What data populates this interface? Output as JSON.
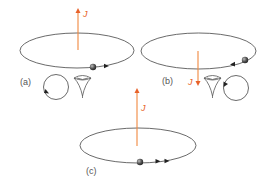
{
  "figure": {
    "panels": [
      {
        "id": "a",
        "label": "(a)",
        "angular_momentum_label": "J",
        "angular_momentum_direction": "up",
        "orbit_direction": "counterclockwise-from-above",
        "observer_view_rotation": "counterclockwise"
      },
      {
        "id": "b",
        "label": "(b)",
        "angular_momentum_label": "J",
        "angular_momentum_direction": "down",
        "orbit_direction": "clockwise-from-above",
        "observer_view_rotation": "clockwise"
      },
      {
        "id": "c",
        "label": "(c)",
        "angular_momentum_label": "J",
        "angular_momentum_direction": "up",
        "orbit_direction": "counterclockwise-from-above",
        "observer_view_rotation": "none"
      }
    ],
    "icons": {
      "observer": "eye-icon",
      "particle": "sphere-icon",
      "rotation": "circular-arrow-icon"
    },
    "colors": {
      "angular_momentum": "#f0883e",
      "angular_momentum_text": "#e8622a",
      "orbit": "#444444",
      "particle": "#3a3a3a",
      "label": "#555555"
    }
  }
}
